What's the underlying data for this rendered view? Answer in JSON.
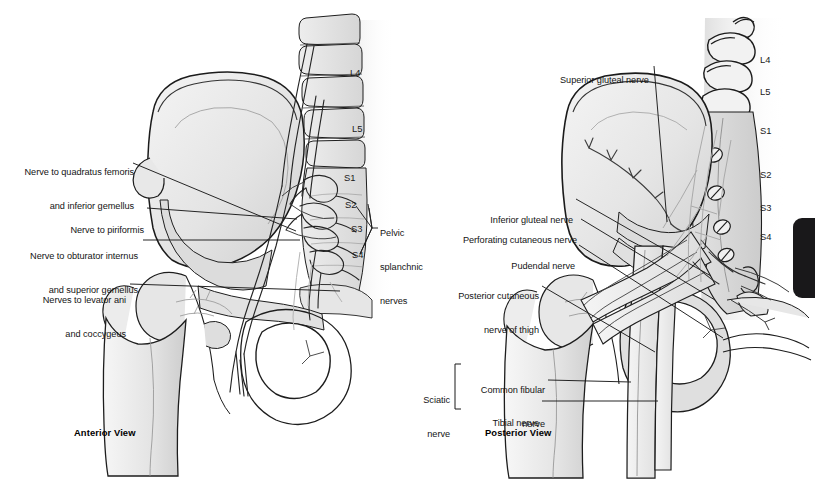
{
  "figure": {
    "background_color": "#ffffff",
    "line_color": "#1a1a1a",
    "bone_fill": "#e9e9e9",
    "bone_fill_dark": "#d4d4d4",
    "nerve_fill": "#f2f2f2",
    "tab_color": "#19181a"
  },
  "panels": [
    {
      "id": "anterior",
      "view_label": "Anterior View",
      "labels": [
        {
          "id": "nerve-quadratus-femoris",
          "lines": [
            "Nerve to quadratus femoris",
            "and inferior gemellus"
          ],
          "align": "right"
        },
        {
          "id": "nerve-piriformis",
          "lines": [
            "Nerve to piriformis"
          ],
          "align": "right"
        },
        {
          "id": "nerve-obturator-internus",
          "lines": [
            "Nerve to obturator internus",
            "and superior gemellus"
          ],
          "align": "right"
        },
        {
          "id": "nerves-levator-ani",
          "lines": [
            "Nerves to levator ani",
            "and coccygeus"
          ],
          "align": "right"
        },
        {
          "id": "pelvic-splanchnic-nerves",
          "lines": [
            "Pelvic",
            "splanchnic",
            "nerves"
          ],
          "align": "left"
        }
      ],
      "vertebrae": [
        "L4",
        "L5",
        "S1",
        "S2",
        "S3",
        "S4"
      ]
    },
    {
      "id": "posterior",
      "view_label": "Posterior View",
      "labels": [
        {
          "id": "superior-gluteal-nerve",
          "lines": [
            "Superior gluteal nerve"
          ],
          "align": "left"
        },
        {
          "id": "inferior-gluteal-nerve",
          "lines": [
            "Inferior gluteal nerve"
          ],
          "align": "right"
        },
        {
          "id": "perforating-cutaneous-nerve",
          "lines": [
            "Perforating cutaneous nerve"
          ],
          "align": "right"
        },
        {
          "id": "pudendal-nerve",
          "lines": [
            "Pudendal nerve"
          ],
          "align": "right"
        },
        {
          "id": "posterior-cutaneous-nerve-of-thigh",
          "lines": [
            "Posterior cutaneous",
            "nerve of thigh"
          ],
          "align": "right"
        },
        {
          "id": "sciatic-nerve",
          "lines": [
            "Sciatic",
            "nerve"
          ],
          "align": "right"
        },
        {
          "id": "common-fibular-nerve",
          "lines": [
            "Common fibular",
            "nerve"
          ],
          "align": "right"
        },
        {
          "id": "tibial-nerve",
          "lines": [
            "Tibial nerve"
          ],
          "align": "right"
        }
      ],
      "vertebrae": [
        "L4",
        "L5",
        "S1",
        "S2",
        "S3",
        "S4"
      ]
    }
  ],
  "anterior": {
    "view_label": "Anterior View",
    "label_quadratus_l1": "Nerve to quadratus femoris",
    "label_quadratus_l2": "and inferior gemellus",
    "label_piriformis_l1": "Nerve to piriformis",
    "label_obturator_l1": "Nerve to obturator internus",
    "label_obturator_l2": "and superior gemellus",
    "label_levator_l1": "Nerves to levator ani",
    "label_levator_l2": "and coccygeus",
    "label_splanchnic_l1": "Pelvic",
    "label_splanchnic_l2": "splanchnic",
    "label_splanchnic_l3": "nerves",
    "v_l4": "L4",
    "v_l5": "L5",
    "v_s1": "S1",
    "v_s2": "S2",
    "v_s3": "S3",
    "v_s4": "S4"
  },
  "posterior": {
    "view_label": "Posterior View",
    "label_superior_gluteal": "Superior gluteal nerve",
    "label_inferior_gluteal": "Inferior gluteal nerve",
    "label_perforating_cutaneous": "Perforating cutaneous nerve",
    "label_pudendal": "Pudendal nerve",
    "label_post_cutaneous_l1": "Posterior cutaneous",
    "label_post_cutaneous_l2": "nerve of thigh",
    "label_sciatic_l1": "Sciatic",
    "label_sciatic_l2": "nerve",
    "label_common_fibular_l1": "Common fibular",
    "label_common_fibular_l2": "nerve",
    "label_tibial": "Tibial nerve",
    "v_l4": "L4",
    "v_l5": "L5",
    "v_s1": "S1",
    "v_s2": "S2",
    "v_s3": "S3",
    "v_s4": "S4"
  }
}
